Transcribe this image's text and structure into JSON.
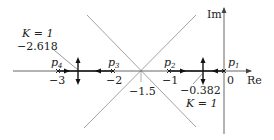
{
  "diagram": {
    "axes": {
      "real_label": "Re",
      "imag_label": "Im",
      "origin_label": "0",
      "ticks": [
        {
          "value": -1,
          "label": "−1"
        },
        {
          "value": -2,
          "label": "−2"
        },
        {
          "value": -3,
          "label": "−3"
        }
      ]
    },
    "poles": [
      {
        "name": "p",
        "sub": "1",
        "value": 0
      },
      {
        "name": "p",
        "sub": "2",
        "value": -1
      },
      {
        "name": "p",
        "sub": "3",
        "value": -2
      },
      {
        "name": "p",
        "sub": "4",
        "value": -3
      }
    ],
    "centroid": {
      "value": -1.5,
      "label": "−1.5"
    },
    "breakaway": [
      {
        "value": -0.382,
        "label": "−0.382",
        "gain_label": "K = 1"
      },
      {
        "value": -2.618,
        "label": "−2.618",
        "gain_label": "K = 1"
      }
    ],
    "asymptote_angles_deg": [
      45,
      135,
      225,
      315
    ],
    "colors": {
      "locus": "#111111",
      "axis": "#555555",
      "asymptote": "#777777"
    }
  }
}
